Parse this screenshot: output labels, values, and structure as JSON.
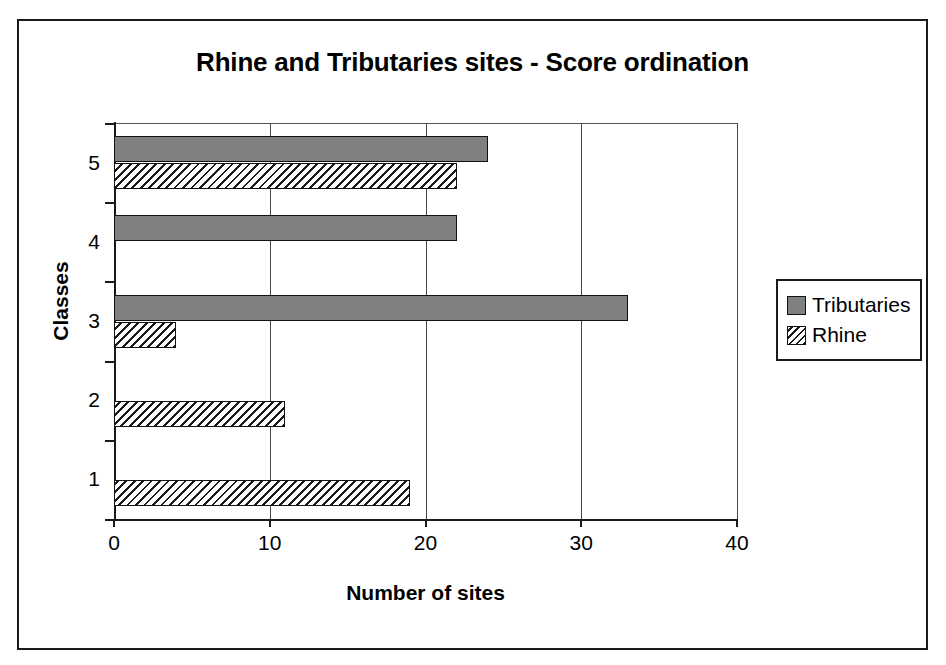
{
  "chart_data": {
    "type": "bar",
    "orientation": "horizontal",
    "title": "Rhine and Tributaries sites - Score ordination",
    "xlabel": "Number of sites",
    "ylabel": "Classes",
    "categories": [
      "1",
      "2",
      "3",
      "4",
      "5"
    ],
    "xlim": [
      0,
      40
    ],
    "xticks": [
      "0",
      "10",
      "20",
      "30",
      "40"
    ],
    "xtick_values": [
      0,
      10,
      20,
      30,
      40
    ],
    "grid": "vertical",
    "legend_position": "right",
    "series": [
      {
        "name": "Tributaries",
        "fill": "solid-gray",
        "color": "#808080",
        "values": [
          0,
          0,
          33,
          22,
          24
        ]
      },
      {
        "name": "Rhine",
        "fill": "diagonal-hatch",
        "color": "#ffffff",
        "values": [
          19,
          11,
          4,
          0,
          22
        ]
      }
    ]
  },
  "legend": {
    "items": [
      {
        "label": "Tributaries",
        "swatch": "tributaries"
      },
      {
        "label": "Rhine",
        "swatch": "rhine"
      }
    ]
  }
}
